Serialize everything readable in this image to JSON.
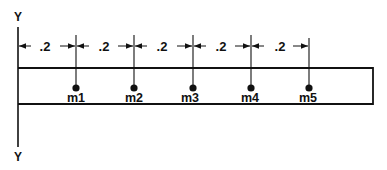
{
  "axis": {
    "top_label": "Y",
    "bottom_label": "Y"
  },
  "dimensions": [
    {
      "label": ".2"
    },
    {
      "label": ".2"
    },
    {
      "label": ".2"
    },
    {
      "label": ".2"
    },
    {
      "label": ".2"
    }
  ],
  "masses": [
    {
      "label": "m1"
    },
    {
      "label": "m2"
    },
    {
      "label": "m3"
    },
    {
      "label": "m4"
    },
    {
      "label": "m5"
    }
  ],
  "colors": {
    "ink": "#111111",
    "background": "#ffffff"
  }
}
